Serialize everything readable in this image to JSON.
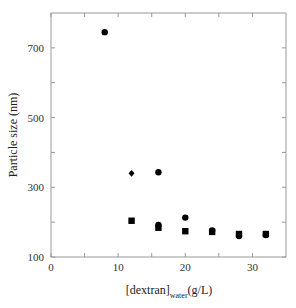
{
  "chart_data": {
    "type": "scatter",
    "title": "",
    "xlabel": "[dextran]",
    "xlabel_subscript": "water",
    "xlabel_unit": "(g/L)",
    "ylabel": "Particle size (nm)",
    "xlim": [
      0,
      35
    ],
    "ylim": [
      100,
      800
    ],
    "x_ticks": [
      0,
      10,
      20,
      30
    ],
    "x_minor_ticks": [
      5,
      15,
      25
    ],
    "y_ticks": [
      100,
      300,
      500,
      700
    ],
    "y_minor_ticks": [
      200,
      400,
      600
    ],
    "grid": false,
    "legend": null,
    "series": [
      {
        "name": "circle",
        "marker": "circle",
        "color": "#000000",
        "points": [
          [
            8,
            745
          ],
          [
            16,
            343
          ],
          [
            16,
            192
          ],
          [
            20,
            213
          ],
          [
            24,
            176
          ],
          [
            28,
            160
          ],
          [
            32,
            163
          ]
        ]
      },
      {
        "name": "diamond",
        "marker": "diamond",
        "color": "#000000",
        "points": [
          [
            12,
            340
          ]
        ]
      },
      {
        "name": "square",
        "marker": "square",
        "color": "#000000",
        "points": [
          [
            12,
            204
          ],
          [
            16,
            184
          ],
          [
            20,
            174
          ],
          [
            24,
            172
          ],
          [
            28,
            166
          ],
          [
            32,
            166
          ]
        ]
      }
    ]
  },
  "labels": {
    "y_axis": "Particle size (nm)",
    "x_axis_main": "[dextran]",
    "x_axis_sub": "water",
    "x_axis_unit": "(g/L)"
  }
}
